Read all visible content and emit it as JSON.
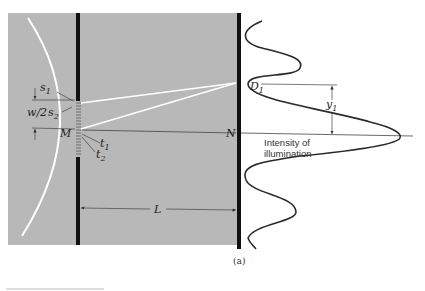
{
  "figure": {
    "caption": "(a)",
    "colors": {
      "panel": "#b8b8b8",
      "barrier": "#111111",
      "ray": "#ffffff",
      "curve": "#2a2a2a",
      "guide": "#4a4a4a"
    }
  },
  "labels": {
    "s1": "s",
    "s1_sub": "1",
    "s2": "s",
    "s2_sub": "2",
    "w2": "w/2",
    "M": "M",
    "N": "N",
    "t1": "t",
    "t1_sub": "1",
    "t2": "t",
    "t2_sub": "2",
    "L": "L",
    "D1": "D",
    "D1_sub": "1",
    "y1": "y",
    "y1_sub": "1",
    "intensity_line1": "Intensity of",
    "intensity_line2": "illumination"
  }
}
